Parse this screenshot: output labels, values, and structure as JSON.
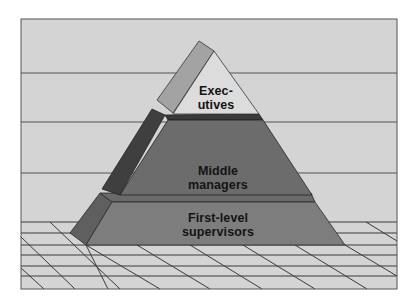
{
  "diagram": {
    "type": "pyramid",
    "title": "",
    "levels": [
      {
        "id": "executives",
        "line1": "Exec-",
        "line2": "utives",
        "rank": "top"
      },
      {
        "id": "middle-managers",
        "line1": "Middle",
        "line2": "managers",
        "rank": "middle"
      },
      {
        "id": "first-level-supervisors",
        "line1": "First-level",
        "line2": "supervisors",
        "rank": "bottom"
      }
    ]
  },
  "colors": {
    "background": "#ffffff",
    "wall": "#d4d4d4",
    "frame_line": "#555555",
    "grid_line": "#3a3a3a",
    "executives_face": "#dcdcdc",
    "executives_side": "#a3a3a3",
    "middle_face": "#6c6c6c",
    "middle_side": "#3f3f3f",
    "middle_top_strip": "#3a3a3a",
    "bottom_face": "#7d7d7d",
    "bottom_side": "#5f5f5f",
    "bottom_top_strip": "#6a6a6a",
    "label_text": "#141414"
  }
}
